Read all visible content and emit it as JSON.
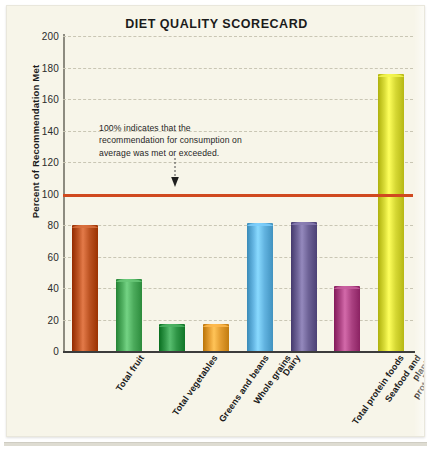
{
  "card": {
    "background_color": "#f7f5e9",
    "border_color": "#e9e7dc"
  },
  "chart_data": {
    "type": "bar",
    "title": "DIET QUALITY SCORECARD",
    "xlabel": "",
    "ylabel": "Percent of Recommendation Met",
    "ylim": [
      0,
      200
    ],
    "ytick_step": 20,
    "grid": true,
    "legend": "none",
    "categories": [
      "Total fruit",
      "Total vegetables",
      "Greens and beans",
      "Whole grains",
      "Dairy",
      "Total protein foods",
      "Seafood and\nplant proteins",
      "Empty calories"
    ],
    "values": [
      80,
      46,
      17,
      17,
      81,
      82,
      41,
      176
    ],
    "bar_colors": [
      "#b9501f",
      "#4aa95a",
      "#2e9445",
      "#e09a2e",
      "#5fb0dd",
      "#6a5f93",
      "#a94080",
      "#d4d632"
    ],
    "yticks": [
      "200",
      "180",
      "160",
      "140",
      "120",
      "100",
      "80",
      "60",
      "40",
      "20",
      "0"
    ],
    "reference_line": {
      "value": 100,
      "color": "#d0491f",
      "label": "100%"
    },
    "annotation": {
      "text": "100% indicates that the recommendation for consumption on average was met or exceeded.",
      "points_to": 100,
      "arrow": "down-arrow"
    }
  }
}
